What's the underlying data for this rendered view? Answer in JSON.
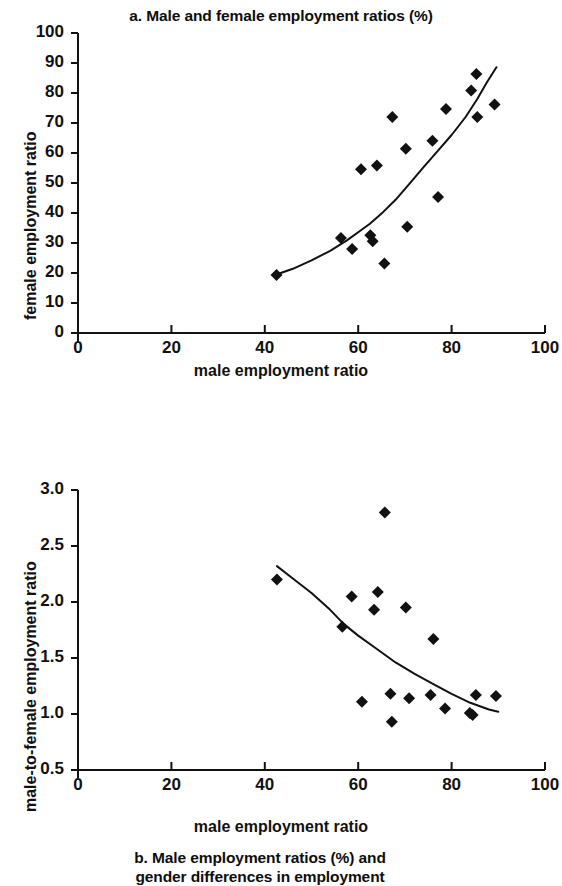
{
  "figure": {
    "panels": [
      {
        "id": "a",
        "title": "a. Male and female employment ratios (%)",
        "xlabel": "male employment ratio",
        "ylabel": "female employment ratio"
      },
      {
        "id": "b",
        "title_line1": "b. Male employment ratios (%) and",
        "title_line2": "gender differences in employment",
        "xlabel": "male employment ratio",
        "ylabel": "male-to-female employment ratio"
      }
    ]
  },
  "chart_data": [
    {
      "type": "scatter",
      "title": "a. Male and female employment ratios (%)",
      "xlabel": "male employment ratio",
      "ylabel": "female employment ratio",
      "xlim": [
        0,
        100
      ],
      "ylim": [
        0,
        100
      ],
      "xticks": [
        0,
        20,
        40,
        60,
        80,
        100
      ],
      "yticks": [
        0,
        10,
        20,
        30,
        40,
        50,
        60,
        70,
        80,
        90,
        100
      ],
      "grid": false,
      "legend": "none",
      "marker": "filled-diamond",
      "color": "#111111",
      "points": [
        {
          "x": 42.5,
          "y": 19.3
        },
        {
          "x": 56.3,
          "y": 31.7
        },
        {
          "x": 58.7,
          "y": 28.0
        },
        {
          "x": 60.6,
          "y": 54.6
        },
        {
          "x": 62.6,
          "y": 32.6
        },
        {
          "x": 63.1,
          "y": 30.6
        },
        {
          "x": 64.0,
          "y": 55.8
        },
        {
          "x": 65.6,
          "y": 23.2
        },
        {
          "x": 67.3,
          "y": 72.0
        },
        {
          "x": 70.2,
          "y": 61.4
        },
        {
          "x": 70.5,
          "y": 35.4
        },
        {
          "x": 75.9,
          "y": 64.1
        },
        {
          "x": 77.1,
          "y": 45.3
        },
        {
          "x": 78.8,
          "y": 74.7
        },
        {
          "x": 84.2,
          "y": 80.8
        },
        {
          "x": 85.3,
          "y": 86.3
        },
        {
          "x": 85.5,
          "y": 72.0
        },
        {
          "x": 89.2,
          "y": 76.2
        }
      ],
      "trendline": {
        "label": "fitted curve",
        "points": [
          {
            "x": 42.5,
            "y": 19.5
          },
          {
            "x": 46.0,
            "y": 21.4
          },
          {
            "x": 50.0,
            "y": 24.2
          },
          {
            "x": 54.0,
            "y": 27.4
          },
          {
            "x": 57.5,
            "y": 30.8
          },
          {
            "x": 60.0,
            "y": 33.6
          },
          {
            "x": 62.5,
            "y": 36.4
          },
          {
            "x": 65.0,
            "y": 39.8
          },
          {
            "x": 68.0,
            "y": 44.4
          },
          {
            "x": 71.0,
            "y": 49.8
          },
          {
            "x": 74.0,
            "y": 55.3
          },
          {
            "x": 77.0,
            "y": 60.6
          },
          {
            "x": 80.0,
            "y": 66.0
          },
          {
            "x": 83.0,
            "y": 72.0
          },
          {
            "x": 85.5,
            "y": 78.0
          },
          {
            "x": 87.5,
            "y": 83.4
          },
          {
            "x": 89.6,
            "y": 88.6
          }
        ]
      }
    },
    {
      "type": "scatter",
      "title": "b. Male employment ratios (%) and gender differences in employment",
      "xlabel": "male employment ratio",
      "ylabel": "male-to-female employment ratio",
      "xlim": [
        0,
        100
      ],
      "ylim": [
        0.5,
        3.0
      ],
      "xticks": [
        0,
        20,
        40,
        60,
        80,
        100
      ],
      "yticks": [
        0.5,
        1.0,
        1.5,
        2.0,
        2.5,
        3.0
      ],
      "grid": false,
      "legend": "none",
      "marker": "filled-diamond",
      "color": "#111111",
      "points": [
        {
          "x": 42.6,
          "y": 2.2
        },
        {
          "x": 56.6,
          "y": 1.78
        },
        {
          "x": 58.6,
          "y": 2.05
        },
        {
          "x": 60.8,
          "y": 1.11
        },
        {
          "x": 63.4,
          "y": 1.93
        },
        {
          "x": 64.2,
          "y": 2.09
        },
        {
          "x": 65.7,
          "y": 2.8
        },
        {
          "x": 66.9,
          "y": 1.18
        },
        {
          "x": 67.2,
          "y": 0.93
        },
        {
          "x": 70.2,
          "y": 1.95
        },
        {
          "x": 70.9,
          "y": 1.14
        },
        {
          "x": 75.5,
          "y": 1.17
        },
        {
          "x": 76.1,
          "y": 1.67
        },
        {
          "x": 78.6,
          "y": 1.05
        },
        {
          "x": 83.9,
          "y": 1.01
        },
        {
          "x": 84.5,
          "y": 0.99
        },
        {
          "x": 85.2,
          "y": 1.17
        },
        {
          "x": 89.5,
          "y": 1.16
        }
      ],
      "trendline": {
        "label": "fitted curve",
        "points": [
          {
            "x": 42.6,
            "y": 2.32
          },
          {
            "x": 46.0,
            "y": 2.21
          },
          {
            "x": 50.0,
            "y": 2.08
          },
          {
            "x": 54.0,
            "y": 1.93
          },
          {
            "x": 57.0,
            "y": 1.8
          },
          {
            "x": 60.0,
            "y": 1.7
          },
          {
            "x": 64.0,
            "y": 1.58
          },
          {
            "x": 68.0,
            "y": 1.46
          },
          {
            "x": 72.0,
            "y": 1.36
          },
          {
            "x": 76.0,
            "y": 1.27
          },
          {
            "x": 80.0,
            "y": 1.18
          },
          {
            "x": 84.0,
            "y": 1.1
          },
          {
            "x": 88.0,
            "y": 1.04
          },
          {
            "x": 90.0,
            "y": 1.02
          }
        ]
      }
    }
  ]
}
